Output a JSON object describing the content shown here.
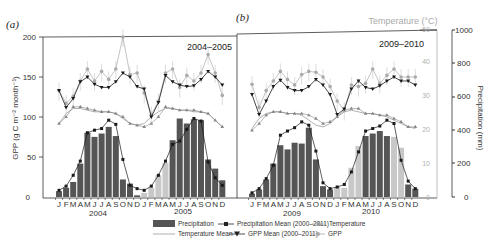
{
  "figure": {
    "panel_labels": [
      "(a)",
      "(b)"
    ],
    "panel_periods": [
      "2004–2005",
      "2009–2010"
    ],
    "year_labels": [
      "2004",
      "2005",
      "2009",
      "2010"
    ],
    "month_labels": [
      "J",
      "F",
      "M",
      "A",
      "M",
      "J",
      "J",
      "A",
      "S",
      "O",
      "N",
      "D",
      "J",
      "F",
      "M",
      "A",
      "M",
      "J",
      "J",
      "A",
      "S",
      "O",
      "N",
      "D"
    ],
    "left_axis_label": "GPP (g C m⁻² month⁻¹)",
    "left_axis_ticks": [
      "0",
      "50",
      "100",
      "150",
      "200"
    ],
    "temp_axis_label": "Temperature (°C)",
    "temp_axis_ticks": [
      "0",
      "10",
      "20",
      "30",
      "40",
      "50"
    ],
    "precip_axis_label": "Precipitation (mm)",
    "precip_axis_ticks": [
      "0",
      "200",
      "400",
      "600",
      "800",
      "1000"
    ],
    "colors": {
      "precip_bar": "#555555",
      "precip_bar_light": "#c8c8c8",
      "black_line": "#1a1a1a",
      "gray_line": "#9a9a9a",
      "temp_axis": "#b0b0b0"
    }
  },
  "legend": {
    "items": [
      {
        "label": "Precipitation",
        "symbol": "bar"
      },
      {
        "label": "Precipitation Mean (2000–2011)",
        "symbol": "line-square"
      },
      {
        "label": "Temperature",
        "symbol": "line-triangle"
      },
      {
        "label": "Temperature Mean",
        "symbol": "line"
      },
      {
        "label": "GPP Mean (2000–2011)",
        "symbol": "line-down-triangle"
      },
      {
        "label": "GPP",
        "symbol": "line-circle"
      }
    ]
  },
  "chart_data": [
    {
      "type": "bar+line",
      "title": "(a) 2004–2005",
      "categories": [
        "Jan 2004",
        "Feb",
        "Mar",
        "Apr",
        "May",
        "Jun",
        "Jul",
        "Aug",
        "Sep",
        "Oct",
        "Nov",
        "Dec",
        "Jan 2005",
        "Feb",
        "Mar",
        "Apr",
        "May",
        "Jun",
        "Jul",
        "Aug",
        "Sep",
        "Oct",
        "Nov",
        "Dec"
      ],
      "xlabel": "Month",
      "ylabel": "GPP (g C m-2 month-1)",
      "ylim": [
        0,
        200
      ],
      "y2label": "Temperature (°C)",
      "y2lim": [
        0,
        50
      ],
      "y3label": "Precipitation (mm)",
      "y3lim": [
        0,
        1000
      ],
      "series": [
        {
          "name": "Precipitation",
          "axis": "precip",
          "values": [
            35,
            55,
            90,
            200,
            385,
            360,
            380,
            420,
            365,
            105,
            80,
            10,
            25,
            55,
            130,
            205,
            340,
            470,
            440,
            465,
            460,
            225,
            170,
            100
          ]
        },
        {
          "name": "Precipitation Mean (2000–2011)",
          "axis": "precip",
          "values": [
            40,
            65,
            130,
            215,
            385,
            400,
            410,
            460,
            435,
            225,
            70,
            50,
            40,
            65,
            130,
            215,
            315,
            335,
            405,
            470,
            455,
            210,
            115,
            70
          ]
        },
        {
          "name": "GPP",
          "axis": "gpp",
          "values": [
            133,
            117,
            126,
            145,
            160,
            145,
            157,
            147,
            160,
            200,
            153,
            155,
            130,
            103,
            120,
            155,
            160,
            137,
            152,
            145,
            155,
            178,
            155,
            127
          ]
        },
        {
          "name": "GPP Mean (2000–2011)",
          "axis": "gpp",
          "values": [
            133,
            112,
            123,
            144,
            150,
            141,
            137,
            137,
            144,
            155,
            150,
            138,
            135,
            100,
            118,
            152,
            144,
            140,
            138,
            139,
            147,
            157,
            150,
            140
          ]
        },
        {
          "name": "Temperature",
          "axis": "temp",
          "values": [
            22,
            24,
            27,
            27,
            26.5,
            26,
            25.5,
            25.5,
            25,
            24,
            22,
            21.5,
            21,
            22,
            24,
            27,
            26.5,
            26,
            26,
            26,
            25.5,
            25,
            23,
            21
          ]
        },
        {
          "name": "Temperature Mean",
          "axis": "temp",
          "values": [
            22,
            25,
            26.5,
            26.5,
            26,
            25.5,
            25.5,
            25.5,
            25,
            23.5,
            22,
            21.5,
            22,
            24,
            25.5,
            26.5,
            26.5,
            26,
            26,
            25.5,
            25.5,
            25,
            23,
            21
          ]
        }
      ]
    },
    {
      "type": "bar+line",
      "title": "(b) 2009–2010",
      "categories": [
        "Jan 2009",
        "Feb",
        "Mar",
        "Apr",
        "May",
        "Jun",
        "Jul",
        "Aug",
        "Sep",
        "Oct",
        "Nov",
        "Dec",
        "Jan 2010",
        "Feb",
        "Mar",
        "Apr",
        "May",
        "Jun",
        "Jul",
        "Aug",
        "Sep",
        "Oct",
        "Nov",
        "Dec"
      ],
      "xlabel": "Month",
      "ylabel": "GPP (g C m-2 month-1)",
      "ylim": [
        0,
        200
      ],
      "y2label": "Temperature (°C)",
      "y2lim": [
        0,
        50
      ],
      "y3label": "Precipitation (mm)",
      "y3lim": [
        0,
        1000
      ],
      "series": [
        {
          "name": "Precipitation",
          "axis": "precip",
          "values": [
            20,
            45,
            105,
            200,
            310,
            285,
            325,
            320,
            415,
            225,
            65,
            45,
            60,
            55,
            175,
            305,
            365,
            380,
            395,
            365,
            360,
            295,
            75,
            50
          ]
        },
        {
          "name": "Precipitation Mean (2000–2011)",
          "axis": "precip",
          "values": [
            25,
            50,
            110,
            190,
            370,
            395,
            415,
            450,
            430,
            275,
            85,
            50,
            60,
            75,
            150,
            270,
            395,
            410,
            425,
            460,
            440,
            220,
            95,
            50
          ]
        },
        {
          "name": "GPP",
          "axis": "gpp",
          "values": [
            141,
            112,
            133,
            145,
            157,
            147,
            140,
            153,
            157,
            156,
            150,
            138,
            120,
            108,
            140,
            138,
            142,
            160,
            142,
            152,
            160,
            150,
            150,
            150
          ]
        },
        {
          "name": "GPP Mean (2000–2011)",
          "axis": "gpp",
          "values": [
            128,
            103,
            120,
            138,
            146,
            137,
            133,
            133,
            138,
            147,
            140,
            128,
            103,
            110,
            135,
            145,
            137,
            135,
            139,
            145,
            150,
            145,
            145,
            140
          ]
        },
        {
          "name": "Temperature",
          "axis": "temp",
          "values": [
            20,
            22,
            24.5,
            25.5,
            25.5,
            25,
            25,
            25,
            24.5,
            23.5,
            22,
            22.5,
            24,
            26,
            26.5,
            26.5,
            25,
            25,
            24.5,
            24.5,
            23.5,
            22.5,
            21,
            21
          ]
        },
        {
          "name": "Temperature Mean",
          "axis": "temp",
          "values": [
            20.5,
            23.5,
            25,
            25.5,
            25.5,
            25,
            25,
            24.5,
            23,
            21.5,
            21,
            22,
            24,
            25.5,
            26,
            25.5,
            25,
            25,
            24.5,
            24,
            23,
            22,
            21,
            20.5
          ]
        }
      ],
      "light_bar_indices": [
        12,
        13,
        14,
        15,
        20,
        21
      ]
    }
  ]
}
